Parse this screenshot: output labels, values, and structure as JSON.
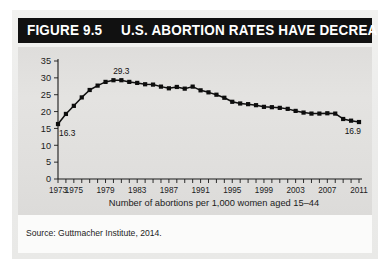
{
  "figure": {
    "number_label": "FIGURE 9.5",
    "title": "U.S. ABORTION RATES HAVE DECREASED",
    "source_note": "Source: Guttmacher Institute, 2014."
  },
  "colors": {
    "title_bar_background": "#111111",
    "title_bar_text": "#ffffff",
    "plot_background": "#e0dfdd",
    "card_background": "#ececeb",
    "footer_background": "#fbfbfa",
    "line": "#101010",
    "marker": "#0d0d0d",
    "axis": "#1a1a1a"
  },
  "chart_data": {
    "type": "line",
    "title": "U.S. ABORTION RATES HAVE DECREASED",
    "xlabel": "Number of abortions per 1,000 women aged 15–44",
    "ylabel": "",
    "xlim": [
      1973,
      2011
    ],
    "ylim": [
      0,
      35
    ],
    "grid": false,
    "legend": false,
    "y_ticks": [
      0,
      5,
      10,
      15,
      20,
      25,
      30,
      35
    ],
    "y_tick_labels": [
      "0",
      "5",
      "10",
      "15",
      "20",
      "25",
      "30",
      "35"
    ],
    "x_tick_labels": [
      "1973",
      "1975",
      "1979",
      "1983",
      "1987",
      "1991",
      "1995",
      "1999",
      "2003",
      "2007",
      "2011"
    ],
    "x_tick_label_years": [
      1973,
      1975,
      1979,
      1983,
      1987,
      1991,
      1995,
      1999,
      2003,
      2007,
      2011
    ],
    "x_minor_tick_interval": 1,
    "annotations": [
      {
        "label": "16.3",
        "year": 1973,
        "value": 16.3,
        "position": "below-right"
      },
      {
        "label": "29.3",
        "year": 1981,
        "value": 29.3,
        "position": "above"
      },
      {
        "label": "16.9",
        "year": 2011,
        "value": 16.9,
        "position": "below-left"
      }
    ],
    "x": [
      1973,
      1974,
      1975,
      1976,
      1977,
      1978,
      1979,
      1980,
      1981,
      1982,
      1983,
      1984,
      1985,
      1986,
      1987,
      1988,
      1989,
      1990,
      1991,
      1992,
      1993,
      1994,
      1995,
      1996,
      1997,
      1998,
      1999,
      2000,
      2001,
      2002,
      2003,
      2004,
      2005,
      2006,
      2007,
      2008,
      2009,
      2010,
      2011
    ],
    "values": [
      16.3,
      19.3,
      21.7,
      24.2,
      26.4,
      27.7,
      28.8,
      29.3,
      29.3,
      28.8,
      28.5,
      28.1,
      28.0,
      27.4,
      26.9,
      27.3,
      26.8,
      27.4,
      26.3,
      25.7,
      25.0,
      24.1,
      22.9,
      22.4,
      22.2,
      21.9,
      21.4,
      21.3,
      21.1,
      20.8,
      20.2,
      19.7,
      19.4,
      19.4,
      19.5,
      19.4,
      17.8,
      17.3,
      16.9
    ]
  }
}
